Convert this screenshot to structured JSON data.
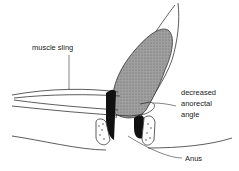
{
  "diagram": {
    "labels": {
      "muscle_sling": "muscle sling",
      "angle_line1": "decreased",
      "angle_line2": "anorectal",
      "angle_line3": "angle",
      "anus": "Anus"
    },
    "colors": {
      "line": "#333333",
      "stool_fill": "#9a9a9a",
      "sphincter_dark": "#111111",
      "background": "#ffffff"
    }
  }
}
